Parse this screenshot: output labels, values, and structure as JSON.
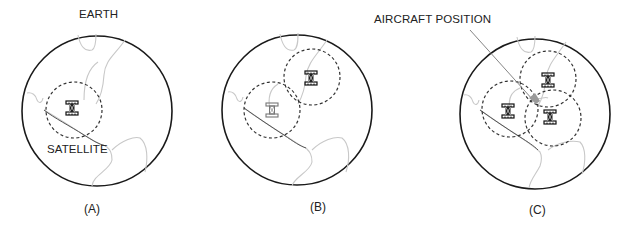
{
  "labels": {
    "earth": "EARTH",
    "satellite": "SATELLITE",
    "aircraft_position": "AIRCRAFT POSITION"
  },
  "panels": [
    {
      "caption": "(A)",
      "satellites": 1,
      "description": "Single satellite coverage circle on Earth"
    },
    {
      "caption": "(B)",
      "satellites": 2,
      "description": "Two satellite coverage circles intersecting"
    },
    {
      "caption": "(C)",
      "satellites": 3,
      "description": "Three satellite coverage circles intersecting at aircraft position"
    }
  ],
  "colors": {
    "earth_outline": "#1a1a1a",
    "coastline": "#c8c8c8",
    "coverage_dashed": "#333333",
    "aircraft_marker": "#9a9a9a"
  }
}
